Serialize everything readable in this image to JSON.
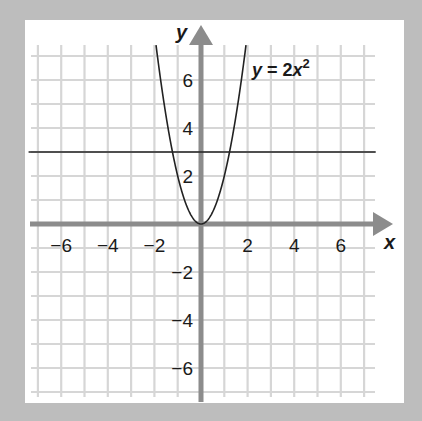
{
  "chart_data": {
    "type": "line",
    "title": "",
    "xlabel": "x",
    "ylabel": "y",
    "xlim": [
      -7,
      7
    ],
    "ylim": [
      -7,
      7
    ],
    "grid": true,
    "x_ticks": [
      -6,
      -4,
      -2,
      2,
      4,
      6
    ],
    "y_ticks": [
      -6,
      -4,
      -2,
      2,
      4,
      6
    ],
    "x_tick_labels": [
      "−6",
      "−4",
      "−2",
      "2",
      "4",
      "6"
    ],
    "y_tick_labels": [
      "−6",
      "−4",
      "−2",
      "2",
      "4",
      "6"
    ],
    "series": [
      {
        "name": "y = 2x²",
        "equation": "y = 2x^2",
        "x": [
          -1.93,
          -1.5,
          -1,
          -0.5,
          0,
          0.5,
          1,
          1.5,
          1.93
        ],
        "y": [
          7.45,
          4.5,
          2,
          0.5,
          0,
          0.5,
          2,
          4.5,
          7.45
        ]
      },
      {
        "name": "y = 3",
        "equation": "y = 3",
        "x": [
          -7.4,
          7.5
        ],
        "y": [
          3,
          3
        ]
      }
    ],
    "annotations": [
      {
        "text": "y = 2x²",
        "position": "upper right of parabola"
      }
    ]
  },
  "labels": {
    "x_axis": "x",
    "y_axis": "y",
    "equation_main": "y = 2x",
    "equation_exp": "2"
  },
  "colors": {
    "border": "#bdbdbd",
    "background": "#ffffff",
    "grid": "#d6d6d6",
    "axis": "#8c8c8c",
    "curve": "#222222"
  }
}
